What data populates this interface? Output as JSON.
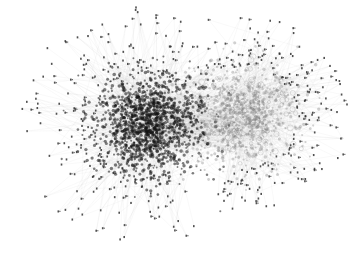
{
  "figure": {
    "type": "network-graph",
    "width": 356,
    "height": 273,
    "background": "#ffffff"
  },
  "clusters": [
    {
      "name": "left-dense-cluster",
      "cx": 150,
      "cy": 125,
      "rx": 58,
      "ry": 55,
      "core_nodes": 1400,
      "node_color": "#141414",
      "edge_color": "#1a1a1a",
      "peripheral_nodes": 230,
      "peripheral_reach": 2.3,
      "peripheral_angle_bias": "left"
    },
    {
      "name": "right-light-cluster",
      "cx": 240,
      "cy": 115,
      "rx": 60,
      "ry": 55,
      "core_nodes": 650,
      "node_color": "#7a7a7a",
      "edge_color": "#8a8a8a",
      "peripheral_nodes": 180,
      "peripheral_reach": 1.9,
      "peripheral_angle_bias": "right"
    }
  ],
  "edge_style": {
    "color": "#c8c8c8",
    "opacity": 0.35,
    "width": 0.3
  },
  "node_style": {
    "peripheral_color": "#333333",
    "peripheral_size": 1.6
  },
  "seed": 17
}
